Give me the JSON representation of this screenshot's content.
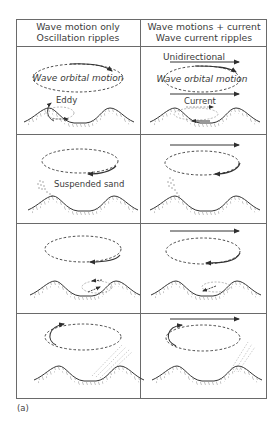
{
  "header": {
    "left_col": {
      "line1": "Wave motion only",
      "line2": "Oscillation ripples"
    },
    "right_col": {
      "line1": "Wave motions + current",
      "line2": "Wave current ripples"
    }
  },
  "labels": {
    "wave_orbital_motion_left": "Wave orbital motion",
    "wave_orbital_motion_right": "Wave orbital motion",
    "eddy": "Eddy",
    "unidirectional": "Unidirectional",
    "current": "Current",
    "suspended_sand": "Suspended sand"
  },
  "caption": "(a)",
  "colors": {
    "line": "#3a3a3a",
    "grid": "#6a6a6a",
    "sand": "#9a9a9a"
  },
  "rows": [
    {
      "index": 1,
      "left": "Orbital motion with eddy forming behind ripple crest",
      "right": "Orbital motion with unidirectional current"
    },
    {
      "index": 2,
      "left": "Suspended sand ejected above ripple",
      "right": "Suspended sand ejected above ripple"
    },
    {
      "index": 3,
      "left": "Eddy forms on opposite flank",
      "right": "Eddy forms on flank"
    },
    {
      "index": 4,
      "left": "Suspended sand plume rising",
      "right": "Suspended sand plume rising"
    }
  ]
}
